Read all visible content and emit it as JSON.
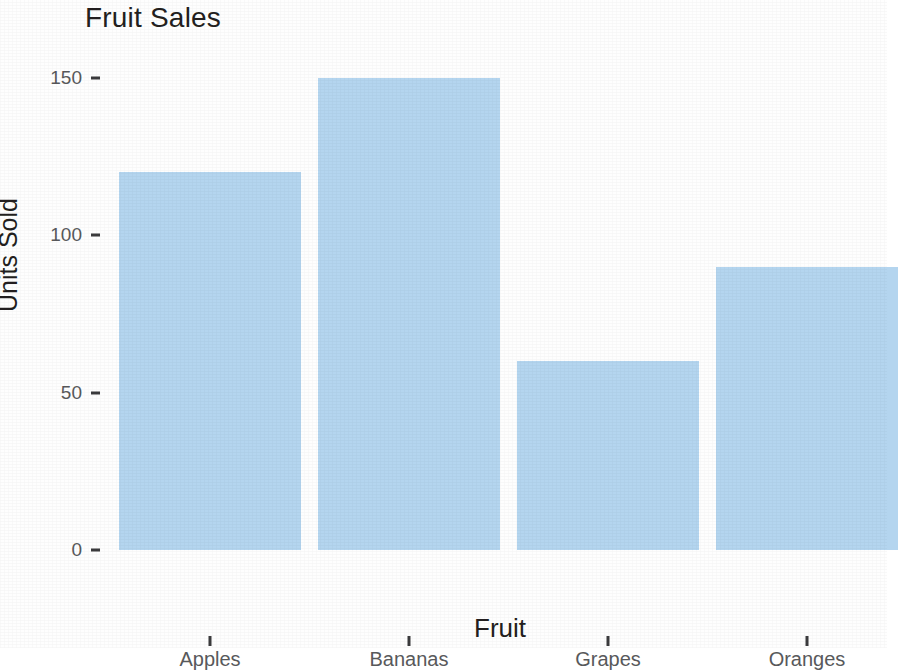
{
  "chart_data": {
    "type": "bar",
    "title": "Fruit Sales",
    "xlabel": "Fruit",
    "ylabel": "Units Sold",
    "categories": [
      "Apples",
      "Bananas",
      "Grapes",
      "Oranges"
    ],
    "values": [
      120,
      150,
      60,
      90
    ],
    "ytick_labels": [
      "0",
      "50",
      "100",
      "150"
    ],
    "ytick_values": [
      0,
      50,
      100,
      150
    ],
    "ylim": [
      0,
      155
    ],
    "grid": false,
    "legend": null,
    "bar_color": "#b4d5ef",
    "text_color": "#231f20",
    "tick_label_color": "#58595b",
    "background_color": "#ffffff"
  }
}
